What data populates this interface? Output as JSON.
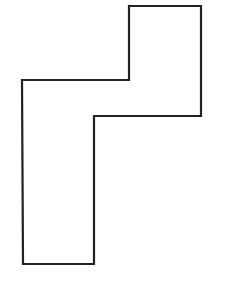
{
  "diagram": {
    "type": "polygon-outline",
    "canvas": {
      "width": 238,
      "height": 287,
      "background": "#ffffff"
    },
    "shape": {
      "name": "stepped-polygon",
      "stroke": "#222222",
      "stroke_width": 2.2,
      "fill": "none",
      "points": [
        [
          129,
          6
        ],
        [
          201,
          6
        ],
        [
          201,
          116
        ],
        [
          94,
          116
        ],
        [
          94,
          264
        ],
        [
          23,
          264
        ],
        [
          22,
          80
        ],
        [
          129,
          80
        ]
      ]
    }
  }
}
